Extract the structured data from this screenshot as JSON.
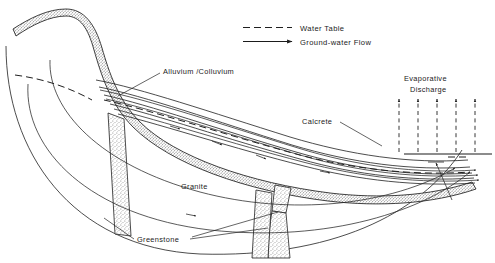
{
  "figure": {
    "kind": "geologic-cross-section",
    "background_color": "#ffffff",
    "line_color": "#1f1f1f"
  },
  "legend": {
    "items": [
      {
        "key": "water-table",
        "label": "Water Table",
        "style": "dashed-line"
      },
      {
        "key": "ground-water-flow",
        "label": "Ground-water  Flow",
        "style": "arrow-line"
      }
    ]
  },
  "labels": {
    "alluvium": "Alluvium /Colluvium",
    "calcrete": "Calcrete",
    "evaporative_line1": "Evaporative",
    "evaporative_line2": "Discharge",
    "granite": "Granite",
    "greenstone": "Greenstone"
  }
}
